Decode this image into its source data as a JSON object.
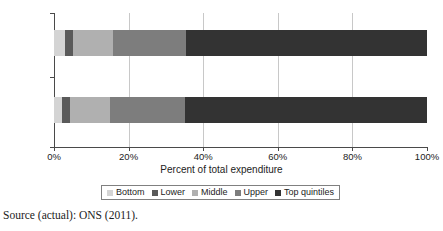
{
  "chart_data": {
    "type": "bar",
    "orientation": "horizontal",
    "stacked": true,
    "normalized_percent": true,
    "title": "",
    "xlabel": "Percent of total expenditure",
    "ylabel": "",
    "xlim": [
      0,
      100
    ],
    "xticks": [
      0,
      20,
      40,
      60,
      80,
      100
    ],
    "xtick_labels": [
      "0%",
      "20%",
      "40%",
      "60%",
      "80%",
      "100%"
    ],
    "categories": [
      "Model",
      "Actual"
    ],
    "grid": "vertical",
    "legend_position": "bottom",
    "series": [
      {
        "name": "Bottom",
        "color": "#d4d4d4",
        "values": [
          3.0,
          2.2
        ]
      },
      {
        "name": "Lower",
        "color": "#5a5a5a",
        "values": [
          2.0,
          2.0
        ]
      },
      {
        "name": "Middle",
        "color": "#b0b0b0",
        "values": [
          10.8,
          10.8
        ]
      },
      {
        "name": "Upper",
        "color": "#7d7d7d",
        "values": [
          19.7,
          20.0
        ]
      },
      {
        "name": "Top quintiles",
        "color": "#333333",
        "values": [
          64.5,
          65.0
        ]
      }
    ],
    "cumulative_breaks": {
      "Model": [
        0,
        3.0,
        5.0,
        15.8,
        35.5,
        100
      ],
      "Actual": [
        0,
        2.2,
        4.2,
        15.0,
        35.0,
        100
      ]
    }
  },
  "axes": {
    "x_title": "Percent of total expenditure",
    "x_tick_labels": [
      "0%",
      "20%",
      "40%",
      "60%",
      "80%",
      "100%"
    ],
    "y_tick_labels": [
      "Model",
      "Actual"
    ]
  },
  "legend": {
    "items": [
      {
        "label": "Bottom"
      },
      {
        "label": "Lower"
      },
      {
        "label": "Middle"
      },
      {
        "label": "Upper"
      },
      {
        "label": "Top quintiles"
      }
    ]
  },
  "source": {
    "note": "Source (actual): ONS (2011)."
  }
}
